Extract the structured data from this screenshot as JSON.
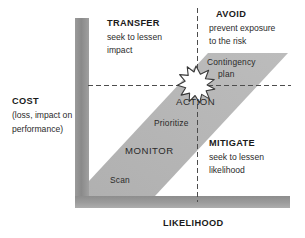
{
  "diagram": {
    "type": "risk-matrix",
    "axes": {
      "y": {
        "title": "COST",
        "subtitle_line1": "(loss, impact on",
        "subtitle_line2": "performance)",
        "color": "#8c8c8c"
      },
      "x": {
        "title": "LIKELIHOOD",
        "color": "#8c8c8c"
      }
    },
    "quadrants": [
      {
        "id": "transfer",
        "position": "top-left",
        "title": "TRANSFER",
        "desc_line1": "seek to lessen",
        "desc_line2": "impact"
      },
      {
        "id": "avoid",
        "position": "top-right",
        "title": "AVOID",
        "desc_line1": "prevent exposure",
        "desc_line2": "to the risk"
      },
      {
        "id": "mitigate",
        "position": "bottom-right",
        "title": "MITIGATE",
        "desc_line1": "seek to lessen",
        "desc_line2": "likelihood"
      },
      {
        "id": "accept",
        "position": "bottom-left",
        "title": "",
        "desc_line1": "",
        "desc_line2": ""
      }
    ],
    "band": {
      "color": "#b3b3b3",
      "labels": [
        {
          "id": "contingency-plan-line1",
          "text": "Contingency"
        },
        {
          "id": "contingency-plan-line2",
          "text": "plan"
        },
        {
          "id": "action",
          "text": "ACTION"
        },
        {
          "id": "prioritize",
          "text": "Prioritize"
        },
        {
          "id": "monitor",
          "text": "MONITOR"
        },
        {
          "id": "scan",
          "text": "Scan"
        }
      ]
    },
    "marker": {
      "id": "starburst-icon",
      "shape": "starburst",
      "fill": "#ffffff",
      "stroke": "#333333"
    },
    "gridlines": {
      "style": "dashed",
      "color": "#555555"
    }
  }
}
